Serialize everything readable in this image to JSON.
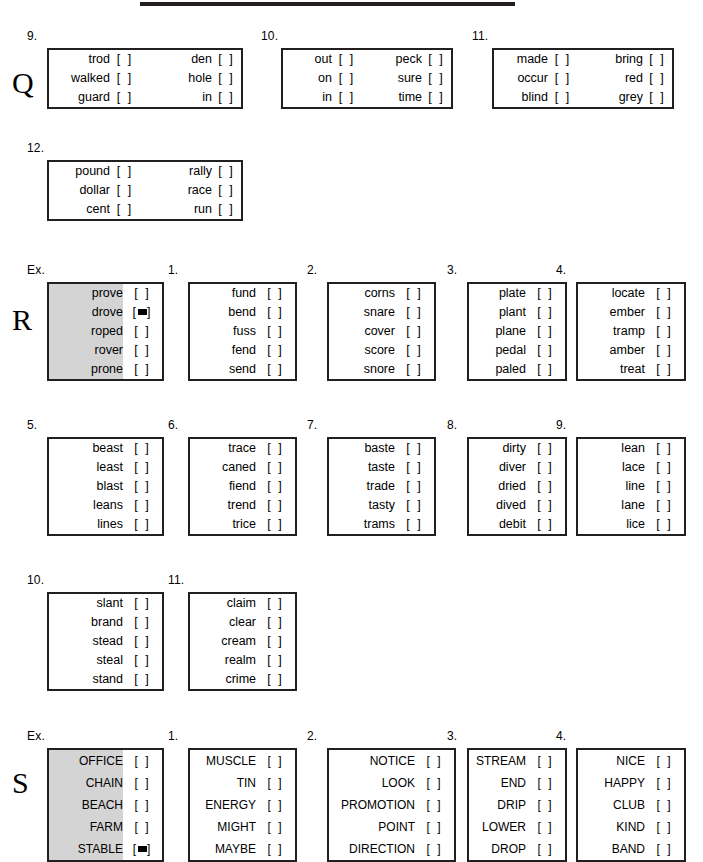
{
  "page": {
    "top_rule": true,
    "checkbox_empty": "[   ]",
    "checkbox_marked": "[■]"
  },
  "sections": [
    {
      "letter": "Q",
      "letter_top": 68,
      "bands": [
        {
          "top": 48,
          "boxes": [
            {
              "number": "9.",
              "left": 47,
              "word_w": 62,
              "chk_w": 30,
              "double": true,
              "rows": [
                {
                  "word": "trod",
                  "word2": "den",
                  "mark": false,
                  "mark2": false
                },
                {
                  "word": "walked",
                  "word2": "hole",
                  "mark": false,
                  "mark2": false
                },
                {
                  "word": "guard",
                  "word2": "in",
                  "mark": false,
                  "mark2": false
                }
              ]
            },
            {
              "number": "10.",
              "left": 281,
              "word_w": 50,
              "chk_w": 30,
              "double": true,
              "rows": [
                {
                  "word": "out",
                  "word2": "peck",
                  "mark": false,
                  "mark2": false
                },
                {
                  "word": "on",
                  "word2": "sure",
                  "mark": false,
                  "mark2": false
                },
                {
                  "word": "in",
                  "word2": "time",
                  "mark": false,
                  "mark2": false
                }
              ]
            },
            {
              "number": "11.",
              "left": 492,
              "word_w": 55,
              "chk_w": 30,
              "double": true,
              "rows": [
                {
                  "word": "made",
                  "word2": "bring",
                  "mark": false,
                  "mark2": false
                },
                {
                  "word": "occur",
                  "word2": "red",
                  "mark": false,
                  "mark2": false
                },
                {
                  "word": "blind",
                  "word2": "grey",
                  "mark": false,
                  "mark2": false
                }
              ]
            }
          ]
        },
        {
          "top": 160,
          "boxes": [
            {
              "number": "12.",
              "left": 47,
              "word_w": 62,
              "chk_w": 30,
              "double": true,
              "rows": [
                {
                  "word": "pound",
                  "word2": "rally",
                  "mark": false,
                  "mark2": false
                },
                {
                  "word": "dollar",
                  "word2": "race",
                  "mark": false,
                  "mark2": false
                },
                {
                  "word": "cent",
                  "word2": "run",
                  "mark": false,
                  "mark2": false
                }
              ]
            }
          ]
        }
      ]
    },
    {
      "letter": "R",
      "letter_top": 305,
      "bands": [
        {
          "top": 282,
          "boxes": [
            {
              "number": "Ex.",
              "left": 47,
              "word_w": 75,
              "chk_w": 40,
              "example": true,
              "rows": [
                {
                  "word": "prove",
                  "mark": false
                },
                {
                  "word": "drove",
                  "mark": true
                },
                {
                  "word": "roped",
                  "mark": false
                },
                {
                  "word": "rover",
                  "mark": false
                },
                {
                  "word": "prone",
                  "mark": false
                }
              ]
            },
            {
              "number": "1.",
              "left": 188,
              "word_w": 67,
              "chk_w": 40,
              "rows": [
                {
                  "word": "fund",
                  "mark": false
                },
                {
                  "word": "bend",
                  "mark": false
                },
                {
                  "word": "fuss",
                  "mark": false
                },
                {
                  "word": "fend",
                  "mark": false
                },
                {
                  "word": "send",
                  "mark": false
                }
              ]
            },
            {
              "number": "2.",
              "left": 327,
              "word_w": 67,
              "chk_w": 40,
              "rows": [
                {
                  "word": "corns",
                  "mark": false
                },
                {
                  "word": "snare",
                  "mark": false
                },
                {
                  "word": "cover",
                  "mark": false
                },
                {
                  "word": "score",
                  "mark": false
                },
                {
                  "word": "snore",
                  "mark": false
                }
              ]
            },
            {
              "number": "3.",
              "left": 467,
              "word_w": 58,
              "chk_w": 40,
              "rows": [
                {
                  "word": "plate",
                  "mark": false
                },
                {
                  "word": "plant",
                  "mark": false
                },
                {
                  "word": "plane",
                  "mark": false
                },
                {
                  "word": "pedal",
                  "mark": false
                },
                {
                  "word": "paled",
                  "mark": false
                }
              ]
            },
            {
              "number": "4.",
              "left": 576,
              "word_w": 68,
              "chk_w": 40,
              "rows": [
                {
                  "word": "locate",
                  "mark": false
                },
                {
                  "word": "ember",
                  "mark": false
                },
                {
                  "word": "tramp",
                  "mark": false
                },
                {
                  "word": "amber",
                  "mark": false
                },
                {
                  "word": "treat",
                  "mark": false
                }
              ]
            }
          ]
        },
        {
          "top": 437,
          "boxes": [
            {
              "number": "5.",
              "left": 47,
              "word_w": 75,
              "chk_w": 40,
              "rows": [
                {
                  "word": "beast",
                  "mark": false
                },
                {
                  "word": "least",
                  "mark": false
                },
                {
                  "word": "blast",
                  "mark": false
                },
                {
                  "word": "leans",
                  "mark": false
                },
                {
                  "word": "lines",
                  "mark": false
                }
              ]
            },
            {
              "number": "6.",
              "left": 188,
              "word_w": 67,
              "chk_w": 40,
              "rows": [
                {
                  "word": "trace",
                  "mark": false
                },
                {
                  "word": "caned",
                  "mark": false
                },
                {
                  "word": "fiend",
                  "mark": false
                },
                {
                  "word": "trend",
                  "mark": false
                },
                {
                  "word": "trice",
                  "mark": false
                }
              ]
            },
            {
              "number": "7.",
              "left": 327,
              "word_w": 67,
              "chk_w": 40,
              "rows": [
                {
                  "word": "baste",
                  "mark": false
                },
                {
                  "word": "taste",
                  "mark": false
                },
                {
                  "word": "trade",
                  "mark": false
                },
                {
                  "word": "tasty",
                  "mark": false
                },
                {
                  "word": "trams",
                  "mark": false
                }
              ]
            },
            {
              "number": "8.",
              "left": 467,
              "word_w": 58,
              "chk_w": 40,
              "rows": [
                {
                  "word": "dirty",
                  "mark": false
                },
                {
                  "word": "diver",
                  "mark": false
                },
                {
                  "word": "dried",
                  "mark": false
                },
                {
                  "word": "dived",
                  "mark": false
                },
                {
                  "word": "debit",
                  "mark": false
                }
              ]
            },
            {
              "number": "9.",
              "left": 576,
              "word_w": 68,
              "chk_w": 40,
              "rows": [
                {
                  "word": "lean",
                  "mark": false
                },
                {
                  "word": "lace",
                  "mark": false
                },
                {
                  "word": "line",
                  "mark": false
                },
                {
                  "word": "lane",
                  "mark": false
                },
                {
                  "word": "lice",
                  "mark": false
                }
              ]
            }
          ]
        },
        {
          "top": 592,
          "boxes": [
            {
              "number": "10.",
              "left": 47,
              "word_w": 75,
              "chk_w": 40,
              "rows": [
                {
                  "word": "slant",
                  "mark": false
                },
                {
                  "word": "brand",
                  "mark": false
                },
                {
                  "word": "stead",
                  "mark": false
                },
                {
                  "word": "steal",
                  "mark": false
                },
                {
                  "word": "stand",
                  "mark": false
                }
              ]
            },
            {
              "number": "11.",
              "left": 188,
              "word_w": 67,
              "chk_w": 40,
              "rows": [
                {
                  "word": "claim",
                  "mark": false
                },
                {
                  "word": "clear",
                  "mark": false
                },
                {
                  "word": "cream",
                  "mark": false
                },
                {
                  "word": "realm",
                  "mark": false
                },
                {
                  "word": "crime",
                  "mark": false
                }
              ]
            }
          ]
        }
      ]
    },
    {
      "letter": "S",
      "letter_top": 768,
      "bands": [
        {
          "top": 748,
          "caps": true,
          "boxes": [
            {
              "number": "Ex.",
              "left": 47,
              "word_w": 75,
              "chk_w": 40,
              "example": true,
              "rows": [
                {
                  "word": "OFFICE",
                  "mark": false
                },
                {
                  "word": "CHAIN",
                  "mark": false
                },
                {
                  "word": "BEACH",
                  "mark": false
                },
                {
                  "word": "FARM",
                  "mark": false
                },
                {
                  "word": "STABLE",
                  "mark": true
                }
              ]
            },
            {
              "number": "1.",
              "left": 188,
              "word_w": 67,
              "chk_w": 40,
              "rows": [
                {
                  "word": "MUSCLE",
                  "mark": false
                },
                {
                  "word": "TIN",
                  "mark": false
                },
                {
                  "word": "ENERGY",
                  "mark": false
                },
                {
                  "word": "MIGHT",
                  "mark": false
                },
                {
                  "word": "MAYBE",
                  "mark": false
                }
              ]
            },
            {
              "number": "2.",
              "left": 327,
              "word_w": 87,
              "chk_w": 40,
              "rows": [
                {
                  "word": "NOTICE",
                  "mark": false
                },
                {
                  "word": "LOOK",
                  "mark": false
                },
                {
                  "word": "PROMOTION",
                  "mark": false
                },
                {
                  "word": "POINT",
                  "mark": false
                },
                {
                  "word": "DIRECTION",
                  "mark": false
                }
              ]
            },
            {
              "number": "3.",
              "left": 467,
              "word_w": 58,
              "chk_w": 40,
              "rows": [
                {
                  "word": "STREAM",
                  "mark": false
                },
                {
                  "word": "END",
                  "mark": false
                },
                {
                  "word": "DRIP",
                  "mark": false
                },
                {
                  "word": "LOWER",
                  "mark": false
                },
                {
                  "word": "DROP",
                  "mark": false
                }
              ]
            },
            {
              "number": "4.",
              "left": 576,
              "word_w": 68,
              "chk_w": 40,
              "rows": [
                {
                  "word": "NICE",
                  "mark": false
                },
                {
                  "word": "HAPPY",
                  "mark": false
                },
                {
                  "word": "CLUB",
                  "mark": false
                },
                {
                  "word": "KIND",
                  "mark": false
                },
                {
                  "word": "BAND",
                  "mark": false
                }
              ]
            }
          ]
        }
      ]
    }
  ]
}
